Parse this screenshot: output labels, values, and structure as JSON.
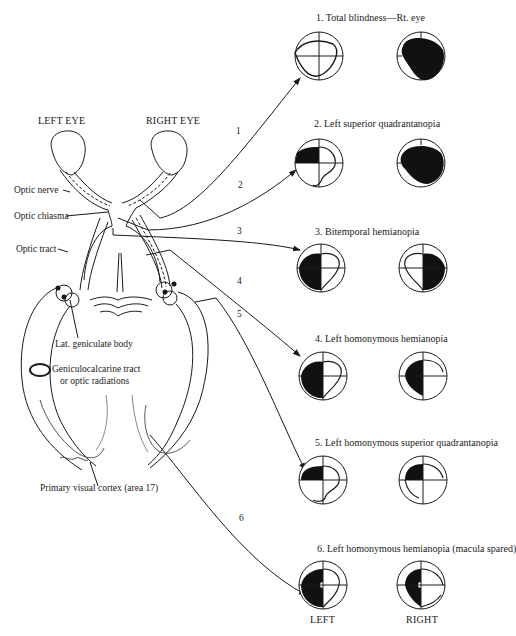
{
  "figure": {
    "eye_labels": {
      "left": "LEFT EYE",
      "right": "RIGHT EYE"
    },
    "anatomy_labels": [
      {
        "id": "optic-nerve",
        "text": "Optic nerve"
      },
      {
        "id": "optic-chiasma",
        "text": "Optic chiasma"
      },
      {
        "id": "optic-tract",
        "text": "Optic tract"
      },
      {
        "id": "lat-geniculate-body",
        "text": "Lat. geniculate body"
      },
      {
        "id": "geniculocalcarine-1",
        "text": "Geniculocalcarine tract"
      },
      {
        "id": "geniculocalcarine-2",
        "text": "or optic radiations"
      },
      {
        "id": "primary-visual-cortex",
        "text": "Primary visual cortex (area 17)"
      }
    ],
    "lesion_numbers": [
      "1",
      "2",
      "3",
      "4",
      "5",
      "6"
    ],
    "visual_field_defects": [
      {
        "number": "1",
        "caption": "1. Total blindness—Rt. eye",
        "left_field": "normal",
        "right_field": "blind"
      },
      {
        "number": "2",
        "caption": "2. Left superior quadrantanopia",
        "left_field": "superior-temporal-quadrant-loss",
        "right_field": "blind"
      },
      {
        "number": "3",
        "caption": "3. Bitemporal hemianopia",
        "left_field": "left-half-loss",
        "right_field": "right-half-loss"
      },
      {
        "number": "4",
        "caption": "4. Left homonymous hemianopia",
        "left_field": "left-half-loss",
        "right_field": "left-half-loss"
      },
      {
        "number": "5",
        "caption": "5. Left homonymous superior quadrantanopia",
        "left_field": "upper-left-quadrant-loss",
        "right_field": "upper-left-quadrant-loss"
      },
      {
        "number": "6",
        "caption": "6. Left homonymous hemianopia (macula spared)",
        "left_field": "left-half-loss-macula-spared",
        "right_field": "left-half-loss-macula-spared"
      }
    ],
    "column_labels": {
      "left": "LEFT",
      "right": "RIGHT"
    },
    "colors": {
      "ink": "#1a1a1a",
      "background": "#ffffff"
    }
  }
}
